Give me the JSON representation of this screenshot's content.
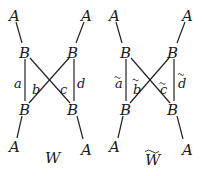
{
  "diagrams": [
    {
      "title": "W",
      "title_tilde": false,
      "nodes": {
        "A_top_left": "A",
        "A_top_right": "A",
        "B_top_left": "B",
        "B_top_right": "B",
        "B_bottom_left": "B",
        "B_bottom_right": "B",
        "A_bottom_left": "A",
        "A_bottom_right": "A"
      },
      "edge_labels": {
        "left_vertical": "a",
        "cross_left": "b",
        "cross_right": "c",
        "right_vertical": "d"
      },
      "edge_labels_tilde": false
    },
    {
      "title": "W",
      "title_tilde": true,
      "nodes": {
        "A_top_left": "A",
        "A_top_right": "A",
        "B_top_left": "B",
        "B_top_right": "B",
        "B_bottom_left": "B",
        "B_bottom_right": "B",
        "A_bottom_left": "A",
        "A_bottom_right": "A"
      },
      "edge_labels": {
        "left_vertical": "a",
        "cross_left": "b",
        "cross_right": "c",
        "right_vertical": "d"
      },
      "edge_labels_tilde": true
    }
  ]
}
